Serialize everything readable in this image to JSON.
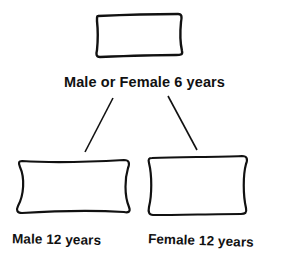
{
  "diagram": {
    "type": "tree",
    "root": {
      "label": "Male or Female 6 years"
    },
    "children": [
      {
        "label": "Male 12 years"
      },
      {
        "label": "Female 12 years"
      }
    ],
    "colors": {
      "stroke": "#111111",
      "background": "#ffffff"
    }
  }
}
